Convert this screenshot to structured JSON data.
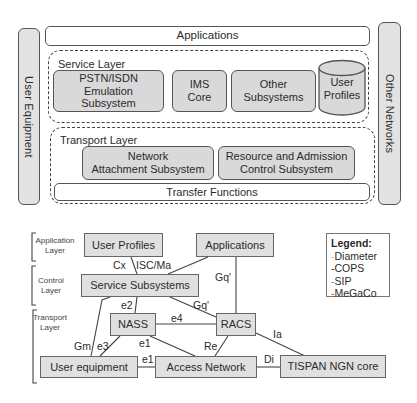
{
  "architecture": {
    "user_equipment": "User Equipment",
    "applications": "Applications",
    "other_networks": "Other Networks",
    "service_layer": {
      "title": "Service Layer",
      "boxes": [
        "PSTN/ISDN\nEmulation\nSubsystem",
        "IMS\nCore",
        "Other\nSubsystems"
      ],
      "pstn_lines": [
        "PSTN/ISDN",
        "Emulation",
        "Subsystem"
      ],
      "ims_lines": [
        "IMS",
        "Core"
      ],
      "other_lines": [
        "Other",
        "Subsystems"
      ],
      "user_profiles_lines": [
        "User",
        "Profiles"
      ]
    },
    "transport_layer": {
      "title": "Transport Layer",
      "nass_lines": [
        "Network",
        "Attachment Subsystem"
      ],
      "racs_lines": [
        "Resource and Admission",
        "Control Subsystem"
      ],
      "transfer_functions": "Transfer Functions"
    }
  },
  "interfaces": {
    "layers": {
      "application": [
        "Application",
        "Layer"
      ],
      "control": [
        "Control",
        "Layer"
      ],
      "transport": [
        "Transport",
        "Layer"
      ]
    },
    "nodes": {
      "user_profiles": "User Profiles",
      "applications": "Applications",
      "service_subsystems": "Service Subsystems",
      "nass": "NASS",
      "racs": "RACS",
      "user_equipment": "User equipment",
      "access_network": "Access Network",
      "tispan_core": "TISPAN NGN core"
    },
    "edges": {
      "cx": "Cx",
      "isc_ma": "ISC/Ma",
      "gq_apps": "Gq'",
      "gq_ss": "Gq'",
      "e2": "e2",
      "e4": "e4",
      "gm": "Gm",
      "e3": "e3",
      "e1_nass": "e1",
      "e1_ue": "e1",
      "re": "Re",
      "ia": "Ia",
      "di": "Di"
    },
    "legend": {
      "title": "Legend:",
      "items": [
        "Diameter",
        "COPS",
        "SIP",
        "MeGaCo"
      ]
    }
  }
}
